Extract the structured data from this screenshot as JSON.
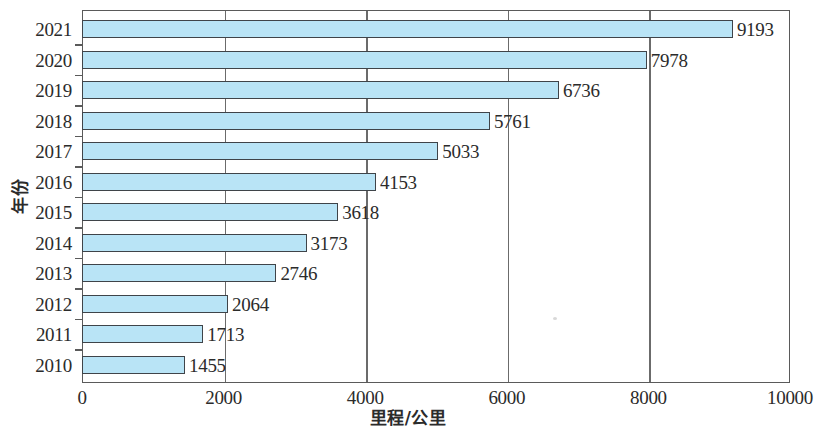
{
  "chart_data": {
    "type": "bar",
    "orientation": "horizontal",
    "title": "",
    "xlabel": "里程/公里",
    "ylabel": "年份",
    "categories": [
      "2010",
      "2011",
      "2012",
      "2013",
      "2014",
      "2015",
      "2016",
      "2017",
      "2018",
      "2019",
      "2020",
      "2021"
    ],
    "values": [
      1455,
      1713,
      2064,
      2746,
      3173,
      3618,
      4153,
      5033,
      5761,
      6736,
      7978,
      9193
    ],
    "series": [
      {
        "name": "里程/公里",
        "values": [
          1455,
          1713,
          2064,
          2746,
          3173,
          3618,
          4153,
          5033,
          5761,
          6736,
          7978,
          9193
        ]
      }
    ],
    "data_labels": [
      "1455",
      "1713",
      "2064",
      "2746",
      "3173",
      "3618",
      "4153",
      "5033",
      "5761",
      "6736",
      "7978",
      "9193"
    ],
    "xlim": [
      0,
      10000
    ],
    "xticks": [
      0,
      2000,
      4000,
      6000,
      8000,
      10000
    ],
    "xtick_labels": [
      "0",
      "2000",
      "4000",
      "6000",
      "8000",
      "10000"
    ],
    "ytick_labels": [
      "2021",
      "2020",
      "2019",
      "2018",
      "2017",
      "2016",
      "2015",
      "2014",
      "2013",
      "2012",
      "2011",
      "2010"
    ],
    "grid": "vertical",
    "legend": "none",
    "bar_fill_color": "#b9e4f6",
    "bar_border_color": "#3f4449",
    "axis_color": "#5a5a5a"
  }
}
